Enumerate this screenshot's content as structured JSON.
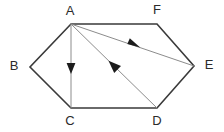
{
  "figure": {
    "type": "geometry-diagram",
    "background_color": "#ffffff",
    "outline_color": "#3a3a3a",
    "interior_line_color": "#8c8c8c",
    "label_color": "#2b2b2b",
    "outline_width": 1.6,
    "interior_width": 1.0,
    "vertices": [
      {
        "name": "A",
        "label": "A",
        "x": 71,
        "y": 24,
        "label_x": 70,
        "label_y": 12
      },
      {
        "name": "B",
        "label": "B",
        "x": 30,
        "y": 67,
        "label_x": 14,
        "label_y": 67
      },
      {
        "name": "C",
        "label": "C",
        "x": 71,
        "y": 108,
        "label_x": 70,
        "label_y": 122
      },
      {
        "name": "D",
        "label": "D",
        "x": 157,
        "y": 108,
        "label_x": 157,
        "label_y": 122
      },
      {
        "name": "E",
        "label": "E",
        "x": 194,
        "y": 66,
        "label_x": 209,
        "label_y": 66
      },
      {
        "name": "F",
        "label": "F",
        "x": 157,
        "y": 24,
        "label_x": 157,
        "label_y": 11
      }
    ],
    "outline_path": "M 71 24 L 30 67 L 71 108 L 157 108 L 194 66 L 157 24 Z",
    "interior_segments": [
      {
        "name": "segment-a-to-c",
        "from": "A",
        "to": "C",
        "x1": 71,
        "y1": 24,
        "x2": 71,
        "y2": 108,
        "arrow": "forward",
        "arrow_at_x": 71,
        "arrow_at_y": 68
      },
      {
        "name": "segment-d-to-a",
        "from": "D",
        "to": "A",
        "x1": 71,
        "y1": 24,
        "x2": 157,
        "y2": 108,
        "arrow": "backward",
        "arrow_at_x": 115,
        "arrow_at_y": 67
      },
      {
        "name": "segment-a-to-e",
        "from": "A",
        "to": "E",
        "x1": 71,
        "y1": 24,
        "x2": 194,
        "y2": 66,
        "arrow": "forward",
        "arrow_at_x": 134,
        "arrow_at_y": 45
      }
    ]
  }
}
